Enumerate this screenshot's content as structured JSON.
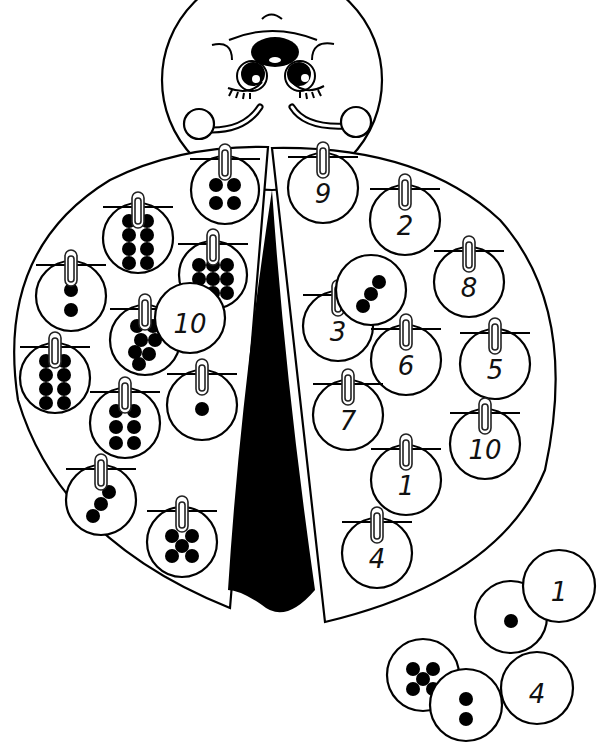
{
  "illustration": {
    "subject": "ladybug counting match worksheet",
    "colors": {
      "ink": "#000000",
      "paper": "#ffffff"
    },
    "head": {
      "features": [
        "antenna-bump",
        "nose",
        "eyes",
        "eyelashes",
        "smile",
        "cheeks"
      ]
    },
    "left_wing_dot_cards": [
      {
        "id": "L1",
        "dots": 4,
        "cx": 225,
        "cy": 190,
        "r": 34
      },
      {
        "id": "L2",
        "dots": 8,
        "cx": 138,
        "cy": 238,
        "r": 35
      },
      {
        "id": "L3",
        "dots": 9,
        "cx": 213,
        "cy": 275,
        "r": 34
      },
      {
        "id": "L4",
        "dots": 2,
        "cx": 71,
        "cy": 296,
        "r": 35
      },
      {
        "id": "L5",
        "dots": 7,
        "cx": 145,
        "cy": 340,
        "r": 35
      },
      {
        "id": "L6",
        "dots": 8,
        "cx": 55,
        "cy": 378,
        "r": 35
      },
      {
        "id": "L7",
        "dots": 6,
        "cx": 125,
        "cy": 423,
        "r": 35
      },
      {
        "id": "L8",
        "dots": 1,
        "cx": 202,
        "cy": 405,
        "r": 35
      },
      {
        "id": "L9",
        "dots": 3,
        "cx": 101,
        "cy": 500,
        "r": 35
      },
      {
        "id": "L10",
        "dots": 5,
        "cx": 182,
        "cy": 542,
        "r": 35
      }
    ],
    "right_wing_number_cards": [
      {
        "id": "R1",
        "label": "9",
        "cx": 323,
        "cy": 188,
        "r": 35
      },
      {
        "id": "R2",
        "label": "2",
        "cx": 405,
        "cy": 220,
        "r": 35
      },
      {
        "id": "R3",
        "label": "8",
        "cx": 469,
        "cy": 282,
        "r": 35
      },
      {
        "id": "R4",
        "label": "3",
        "cx": 338,
        "cy": 326,
        "r": 35
      },
      {
        "id": "R5",
        "label": "6",
        "cx": 406,
        "cy": 360,
        "r": 35
      },
      {
        "id": "R6",
        "label": "5",
        "cx": 495,
        "cy": 364,
        "r": 35
      },
      {
        "id": "R7",
        "label": "7",
        "cx": 348,
        "cy": 415,
        "r": 35
      },
      {
        "id": "R8",
        "label": "10",
        "cx": 485,
        "cy": 444,
        "r": 35
      },
      {
        "id": "R9",
        "label": "1",
        "cx": 406,
        "cy": 480,
        "r": 35
      },
      {
        "id": "R10",
        "label": "4",
        "cx": 377,
        "cy": 553,
        "r": 35
      }
    ],
    "loose_cards": [
      {
        "id": "F1",
        "kind": "number",
        "label": "10",
        "cx": 190,
        "cy": 318,
        "r": 35
      },
      {
        "id": "F2",
        "kind": "dots",
        "dots": 3,
        "cx": 371,
        "cy": 290,
        "r": 35
      },
      {
        "id": "F3",
        "kind": "dots",
        "dots": 1,
        "cx": 511,
        "cy": 617,
        "r": 36
      },
      {
        "id": "F4",
        "kind": "number",
        "label": "1",
        "cx": 559,
        "cy": 586,
        "r": 36
      },
      {
        "id": "F5",
        "kind": "dots",
        "dots": 5,
        "cx": 423,
        "cy": 675,
        "r": 36
      },
      {
        "id": "F6",
        "kind": "dots",
        "dots": 2,
        "cx": 466,
        "cy": 705,
        "r": 36
      },
      {
        "id": "F7",
        "kind": "number",
        "label": "4",
        "cx": 537,
        "cy": 688,
        "r": 36
      }
    ]
  }
}
